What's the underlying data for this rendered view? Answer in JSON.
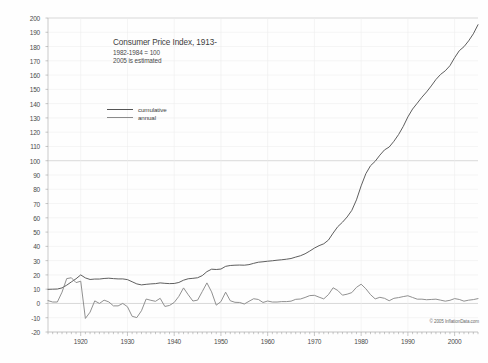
{
  "chart_data": {
    "type": "line",
    "title": "Consumer Price Index, 1913-",
    "subtitle_line1": "1982-1984 = 100",
    "subtitle_line2": "2005 is estimated",
    "xlabel": "",
    "ylabel": "",
    "xlim": [
      1913,
      2005
    ],
    "ylim": [
      -20,
      200
    ],
    "ytick_step": 10,
    "grid": true,
    "legend_position": "upper-left-inside",
    "copyright": "© 2005 InflationData.com",
    "yticks": [
      200,
      190,
      180,
      170,
      160,
      150,
      140,
      130,
      120,
      110,
      100,
      90,
      80,
      70,
      60,
      50,
      40,
      30,
      20,
      10,
      0,
      -10,
      -20
    ],
    "ytick_labels": [
      "200",
      "190",
      "180",
      "170",
      "160",
      "150",
      "140",
      "130",
      "120",
      "110",
      "100",
      "90",
      "80",
      "70",
      "60",
      "50",
      "40",
      "30",
      "20",
      "10",
      "0",
      "-10",
      "-20"
    ],
    "xticks": [
      1920,
      1930,
      1940,
      1950,
      1960,
      1970,
      1980,
      1990,
      2000
    ],
    "xtick_labels": [
      "1920",
      "1930",
      "1940",
      "1950",
      "1960",
      "1970",
      "1980",
      "1990",
      "2000"
    ],
    "x": [
      1913,
      1914,
      1915,
      1916,
      1917,
      1918,
      1919,
      1920,
      1921,
      1922,
      1923,
      1924,
      1925,
      1926,
      1927,
      1928,
      1929,
      1930,
      1931,
      1932,
      1933,
      1934,
      1935,
      1936,
      1937,
      1938,
      1939,
      1940,
      1941,
      1942,
      1943,
      1944,
      1945,
      1946,
      1947,
      1948,
      1949,
      1950,
      1951,
      1952,
      1953,
      1954,
      1955,
      1956,
      1957,
      1958,
      1959,
      1960,
      1961,
      1962,
      1963,
      1964,
      1965,
      1966,
      1967,
      1968,
      1969,
      1970,
      1971,
      1972,
      1973,
      1974,
      1975,
      1976,
      1977,
      1978,
      1979,
      1980,
      1981,
      1982,
      1983,
      1984,
      1985,
      1986,
      1987,
      1988,
      1989,
      1990,
      1991,
      1992,
      1993,
      1994,
      1995,
      1996,
      1997,
      1998,
      1999,
      2000,
      2001,
      2002,
      2003,
      2004,
      2005
    ],
    "series": [
      {
        "name": "cumulative",
        "color": "#555555",
        "values": [
          9.9,
          10.0,
          10.1,
          10.9,
          12.8,
          15.1,
          17.3,
          20.0,
          17.9,
          16.8,
          17.1,
          17.1,
          17.5,
          17.7,
          17.4,
          17.2,
          17.2,
          16.7,
          15.2,
          13.7,
          13.0,
          13.4,
          13.7,
          13.9,
          14.4,
          14.1,
          13.9,
          14.0,
          14.7,
          16.3,
          17.3,
          17.6,
          18.0,
          19.5,
          22.3,
          24.0,
          23.8,
          24.1,
          26.0,
          26.6,
          26.8,
          26.9,
          26.8,
          27.2,
          28.1,
          28.9,
          29.2,
          29.6,
          29.9,
          30.3,
          30.6,
          31.0,
          31.5,
          32.5,
          33.4,
          34.8,
          36.7,
          38.8,
          40.5,
          41.8,
          44.4,
          49.3,
          53.8,
          56.9,
          60.6,
          65.2,
          72.6,
          82.4,
          90.9,
          96.5,
          99.6,
          103.9,
          107.6,
          109.6,
          113.6,
          118.3,
          124.0,
          130.7,
          136.2,
          140.3,
          144.5,
          148.2,
          152.4,
          156.9,
          160.5,
          163.0,
          166.6,
          172.2,
          177.1,
          179.9,
          184.0,
          188.9,
          195.3
        ]
      },
      {
        "name": "annual",
        "color": "#8a8a8a",
        "values": [
          2.0,
          1.0,
          1.0,
          7.9,
          17.4,
          18.0,
          14.6,
          15.6,
          -10.5,
          -6.1,
          1.8,
          0.0,
          2.3,
          1.1,
          -1.7,
          -1.7,
          0.0,
          -2.3,
          -9.0,
          -9.9,
          -5.1,
          3.1,
          2.2,
          1.5,
          3.6,
          -2.1,
          -1.4,
          0.7,
          5.0,
          10.9,
          6.1,
          1.7,
          2.3,
          8.3,
          14.4,
          8.1,
          -1.2,
          1.3,
          7.9,
          1.9,
          0.8,
          0.7,
          -0.4,
          1.5,
          3.3,
          2.8,
          0.7,
          1.7,
          1.0,
          1.0,
          1.3,
          1.3,
          1.6,
          2.9,
          3.1,
          4.2,
          5.5,
          5.7,
          4.4,
          3.2,
          6.2,
          11.0,
          9.1,
          5.8,
          6.5,
          7.6,
          11.3,
          13.5,
          10.3,
          6.2,
          3.2,
          4.3,
          3.6,
          1.9,
          3.6,
          4.1,
          4.8,
          5.4,
          4.2,
          3.0,
          3.0,
          2.6,
          2.8,
          3.0,
          2.3,
          1.6,
          2.2,
          3.4,
          2.8,
          1.6,
          2.3,
          2.7,
          3.4
        ]
      }
    ]
  }
}
